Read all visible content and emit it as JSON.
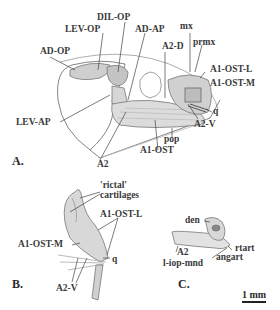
{
  "figure": {
    "panels": {
      "A": {
        "letter": "A.",
        "labels": {
          "ad_op": "AD-OP",
          "lev_op": "LEV-OP",
          "dil_op": "DIL-OP",
          "ad_ap": "AD-AP",
          "a2_d": "A2-D",
          "mx": "mx",
          "prmx": "prmx",
          "a1_ost_l": "A1-OST-L",
          "a1_ost_m": "A1-OST-M",
          "q": "q",
          "a2_v": "A2-V",
          "lev_ap": "LEV-AP",
          "pop": "pop",
          "a1_ost": "A1-OST",
          "a2": "A2"
        }
      },
      "B": {
        "letter": "B.",
        "labels": {
          "rictal_1": "'rictal'",
          "rictal_2": "cartilages",
          "a1_ost_l": "A1-OST-L",
          "a1_ost_m": "A1-OST-M",
          "q": "q",
          "a2_v": "A2-V"
        }
      },
      "C": {
        "letter": "C.",
        "labels": {
          "den": "den",
          "rtart": "rtart",
          "angart": "angart",
          "a2": "A2",
          "l_iop_mnd": "l-iop-mnd"
        }
      }
    },
    "scale_bar": "1 mm",
    "colors": {
      "ink": "#3a3a3a",
      "muscle_fill": "#cfcfcf",
      "line": "#555555"
    }
  }
}
